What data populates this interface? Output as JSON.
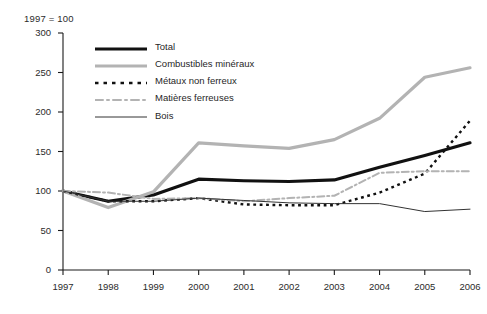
{
  "chart_data": {
    "type": "line",
    "title": "1997 = 100",
    "xlabel": "",
    "ylabel": "",
    "x": [
      1997,
      1998,
      1999,
      2000,
      2001,
      2002,
      2003,
      2004,
      2005,
      2006
    ],
    "categories": [
      "1997",
      "1998",
      "1999",
      "2000",
      "2001",
      "2002",
      "2003",
      "2004",
      "2005",
      "2006"
    ],
    "ylim": [
      0,
      300
    ],
    "yticks": [
      0,
      50,
      100,
      150,
      200,
      250,
      300
    ],
    "ytick_labels": [
      "0",
      "50",
      "100",
      "150",
      "200",
      "250",
      "300"
    ],
    "grid": false,
    "legend_position": "top-left-inside",
    "series": [
      {
        "name": "Total",
        "values": [
          100,
          87,
          95,
          115,
          113,
          112,
          114,
          130,
          145,
          161
        ],
        "color": "#111111",
        "style": "solid",
        "width": 3.2
      },
      {
        "name": "Combustibles minéraux",
        "values": [
          100,
          79,
          99,
          161,
          157,
          154,
          165,
          192,
          244,
          256
        ],
        "color": "#b3b3b3",
        "style": "solid",
        "width": 3.2
      },
      {
        "name": "Métaux non ferreux",
        "values": [
          100,
          87,
          87,
          91,
          83,
          82,
          82,
          98,
          122,
          189
        ],
        "color": "#111111",
        "style": "dotted",
        "width": 2.4
      },
      {
        "name": "Matières ferreuses",
        "values": [
          100,
          98,
          90,
          91,
          87,
          91,
          94,
          123,
          125,
          125
        ],
        "color": "#b3b3b3",
        "style": "dashdot",
        "width": 2.0
      },
      {
        "name": "Bois",
        "values": [
          100,
          87,
          87,
          91,
          88,
          85,
          84,
          84,
          74,
          77
        ],
        "color": "#333333",
        "style": "solid",
        "width": 1.0
      }
    ]
  },
  "axis": {
    "note": "1997 = 100"
  }
}
